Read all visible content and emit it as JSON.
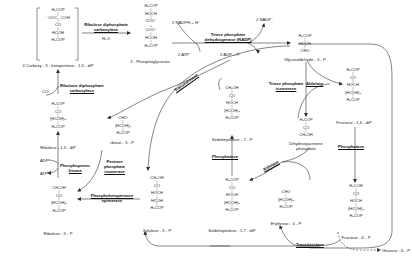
{
  "diagram": {
    "compounds": {
      "carboxy_ketopentose": {
        "formula": [
          "H₂COP",
          "⁻OOC - COH",
          "CO",
          "HCOH",
          "H₂COP"
        ],
        "name": "2 Carboxy - 3 - ketopentose - 1,5 - diP"
      },
      "phosphoglycerate": {
        "formula": [
          "H₂COP",
          "HOCH",
          "COO⁻",
          "+",
          "COO⁻",
          "HCOH",
          "H₂COP"
        ],
        "name": "3 - Phosphoglycerate"
      },
      "glyceraldehyde_3p": {
        "formula": [
          "H₂COP",
          "HOCH",
          "CHO"
        ],
        "name": "Glyceraldehyde - 3 - P"
      },
      "dihydroxyacetone_p": {
        "formula": [
          "H₂COP",
          "CO",
          "CH₂OH"
        ],
        "name_lines": [
          "Dihydroxyacetone",
          "phosphate"
        ]
      },
      "fructose_16_dip": {
        "formula": [
          "H₂COP",
          "CO",
          "HOCH",
          "(HCOH)₂",
          "H₂COP"
        ],
        "name": "Fructose - 1,6 - diP"
      },
      "fructose_6p": {
        "formula": [
          "H₂COH",
          "CO",
          "HOCH",
          "(HCOH)₂",
          "H₂COP"
        ],
        "name": "Fructose - 6 - P"
      },
      "erythrose_4p": {
        "formula": [
          "CHO",
          "(HCOH)₂",
          "H₂COP"
        ],
        "name": "Erythrose - 4 - P"
      },
      "sedoheptulose_17_dip": {
        "formula": [
          "H₂COP",
          "CO",
          "HOCH",
          "(HCOH)₃",
          "H₂COP"
        ],
        "name": "Sedoheptulose - 1,7 - diP"
      },
      "sedoheptulose_7p": {
        "formula": [
          "CH₂OH",
          "CO",
          "HOCH",
          "(HCOH)₃",
          "H₂COP"
        ],
        "name": "Sedoheptulose - 7 - P"
      },
      "xylulose_5p": {
        "formula": [
          "CH₂OH",
          "CO",
          "HOCH",
          "HCOH",
          "H₂COP"
        ],
        "name": "Xylulose - 5 - P"
      },
      "ribose_5p": {
        "formula": [
          "CHO",
          "(HCOH)₃",
          "H₂COP"
        ],
        "name": "ribose - 5 - P"
      },
      "ribulose_5p": {
        "formula": [
          "CH₂OH",
          "CO",
          "(HCOH)₂",
          "H₂COP"
        ],
        "name": "Ribulose - 5 - P"
      },
      "ribulose_15_dip": {
        "formula": [
          "H₂COP",
          "CO",
          "(HCOH)₂",
          "H₂COP"
        ],
        "name": "Ribulose - 1,5 - diP"
      },
      "glucose_6p": {
        "name": "Glucose - 6 - P"
      }
    },
    "enzymes": {
      "rubisco_top": [
        "Ribulose diphosphate",
        "carboxylase"
      ],
      "rubisco_left": [
        "Ribulose diphosphate",
        "carboxylase"
      ],
      "triose_dh": [
        "Triose phosphate",
        "dehydrogenase (NADP)"
      ],
      "triose_isomerase": [
        "Triose phosphate",
        "isomerase"
      ],
      "aldolase_top": [
        "Aldolase"
      ],
      "aldolase_bottom": [
        "Aldolase"
      ],
      "phosphatase_right": [
        "Phosphatase"
      ],
      "phosphatase_mid": [
        "Phosphatase"
      ],
      "transketolase_top": [
        "Transketolase"
      ],
      "transketolase_bottom": [
        "Transketolase"
      ],
      "pentose_isomerase": [
        "Pentose",
        "phosphate",
        "isomerase"
      ],
      "phosphopentokinase": [
        "Phosphopento-",
        "kinase"
      ],
      "epimerase": [
        "Phosphoketopentose",
        "epimerase"
      ]
    },
    "cofactors": {
      "h2o": "H₂O",
      "co2": "CO₂",
      "nadph": "2 NADPH + H⁺",
      "nadp": "2 NADP⁺",
      "atp2": "2 ATP",
      "adp_pi": "2 ADP + Pᵢ",
      "adp": "ADP",
      "atp": "ATP"
    }
  }
}
